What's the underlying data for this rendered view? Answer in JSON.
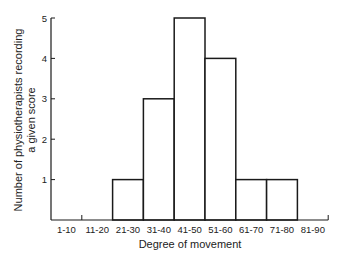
{
  "chart_data": {
    "type": "bar",
    "title": "",
    "xlabel": "Degree of movement",
    "ylabel": "Number of physiotherapists recording a given score",
    "ylabel_lines": [
      "Number of physiotherapists recording",
      "a given score"
    ],
    "categories": [
      "1-10",
      "11-20",
      "21-30",
      "31-40",
      "41-50",
      "51-60",
      "61-70",
      "71-80",
      "81-90"
    ],
    "values": [
      0,
      0,
      1,
      3,
      5,
      4,
      1,
      1,
      0
    ],
    "yticks": [
      1,
      2,
      3,
      4,
      5
    ],
    "ylim": [
      0,
      5
    ],
    "grid": false,
    "legend": null,
    "style": "histogram"
  },
  "colors": {
    "bar_fill": "#ffffff",
    "bar_stroke": "#1a1a1a",
    "axis": "#1a1a1a"
  }
}
